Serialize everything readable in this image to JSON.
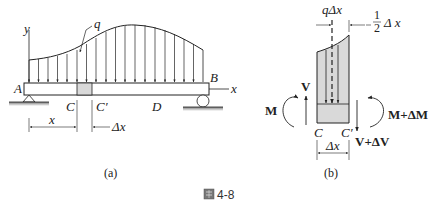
{
  "figure_a": {
    "labels": {
      "y_axis": "y",
      "x_axis": "x",
      "load": "q",
      "A": "A",
      "B": "B",
      "C": "C",
      "C_prime": "C′",
      "D": "D",
      "dim_x": "x",
      "dim_dx": "Δx"
    },
    "sublabel": "(a)"
  },
  "figure_b": {
    "labels": {
      "q_dx": "qΔx",
      "half_num": "1",
      "half_den": "2",
      "half_dx": "Δ x",
      "M": "M",
      "V": "V",
      "M_dM": "M+ΔM",
      "V_dV": "V+ΔV",
      "C": "C",
      "C_prime": "C′",
      "dim_dx": "Δx"
    },
    "sublabel": "(b)"
  },
  "caption": {
    "icon": "figure-icon",
    "text": "4-8"
  },
  "colors": {
    "line": "#222222",
    "fill_gray": "#d9d9d9",
    "ground": "#888888"
  }
}
